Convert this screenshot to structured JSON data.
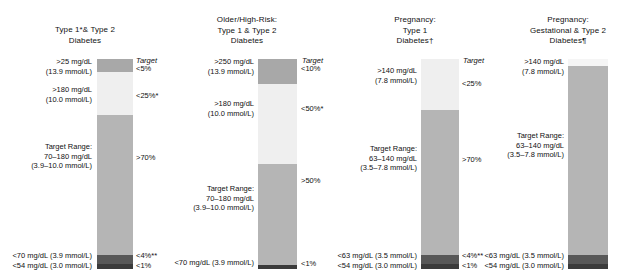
{
  "chart_data": {
    "type": "bar",
    "title": "",
    "subtitle": "",
    "xlabel": "",
    "ylabel": "",
    "ylim": [
      0,
      100
    ],
    "grid": false,
    "legend_position": "none",
    "orientation": "vertical-stacked",
    "target_header": "Target",
    "categories": [
      "Type 1*& Type 2 Diabetes",
      "Older/High-Risk: Type 1 & Type 2 Diabetes",
      "Pregnancy: Type 1 Diabetes",
      "Pregnancy: Gestational & Type 2 Diabetes"
    ],
    "series": [
      {
        "name": "Very High",
        "values": [
          5,
          10,
          0,
          0
        ]
      },
      {
        "name": "High",
        "values": [
          20,
          40,
          25,
          3
        ]
      },
      {
        "name": "Target Range",
        "values": [
          70,
          50,
          70,
          93
        ]
      },
      {
        "name": "Low / Very Low",
        "values": [
          5,
          1,
          5,
          4
        ]
      }
    ],
    "colors": {
      "very_high": "#a8a8a8",
      "high": "#ededed",
      "target_range": "#b5b5b5",
      "low": "#5a5a5a",
      "very_low": "#3d3d3d",
      "text": "#111111",
      "background": "#ffffff"
    }
  },
  "columns": [
    {
      "id": "type1-type2",
      "header_lines": [
        "Type 1*& Type 2",
        "Diabetes"
      ],
      "target_header": "Target",
      "left_labels": [
        {
          "lines": [
            "&gt;25 mg/dL",
            "(13.9 mmol/L)"
          ]
        },
        {
          "lines": [
            "&gt;180 mg/dL",
            "(10.0 mmol/L)"
          ]
        },
        {
          "lines": [
            "Target Range:",
            "70–180 mg/dL",
            "(3.9–10.0 mmol/L)"
          ]
        },
        {
          "lines": [
            "&lt;70 mg/dL (3.9 mmol/L)"
          ]
        },
        {
          "lines": [
            "&lt;54 mg/dL (3.0 mmol/L)"
          ]
        }
      ],
      "right_labels": [
        "&lt;5%",
        "&lt;25%*",
        "&gt;70%",
        "&lt;4%**",
        "&lt;1%"
      ]
    },
    {
      "id": "older-high-risk",
      "header_lines": [
        "Older/High-Risk:",
        "Type 1 & Type 2",
        "Diabetes"
      ],
      "target_header": "Target",
      "left_labels": [
        {
          "lines": [
            "&gt;250 mg/dL",
            "(13.9 mmol/L)"
          ]
        },
        {
          "lines": [
            "&gt;180 mg/dL",
            "(10.0 mmol/L)"
          ]
        },
        {
          "lines": [
            "Target Range:",
            "70–180 mg/dL",
            "(3.9–10.0 mmol/L)"
          ]
        },
        {
          "lines": [
            "&lt;70 mg/dL (3.9 mmol/L)"
          ]
        }
      ],
      "right_labels": [
        "&lt;10%",
        "&lt;50%*",
        "&gt;50%",
        "&lt;1%"
      ]
    },
    {
      "id": "pregnancy-type1",
      "header_lines": [
        "Pregnancy:",
        "Type 1",
        "Diabetes†"
      ],
      "target_header": "Target",
      "left_labels": [
        {
          "lines": [
            "&gt;140 mg/dL",
            "(7.8 mmol/L)"
          ]
        },
        {
          "lines": [
            "Target Range:",
            "63–140 mg/dL",
            "(3.5–7.8 mmol/L)"
          ]
        },
        {
          "lines": [
            "&lt;63 mg/dL (3.5 mmol/L)"
          ]
        },
        {
          "lines": [
            "&lt;54 mg/dL (3.0 mmol/L)"
          ]
        }
      ],
      "right_labels": [
        "&lt;25%",
        "&gt;70%",
        "&lt;4%**",
        "&lt;1%"
      ]
    },
    {
      "id": "pregnancy-gdm-type2",
      "header_lines": [
        "Pregnancy:",
        "Gestational & Type 2",
        "Diabetes¶"
      ],
      "target_header": "",
      "left_labels": [
        {
          "lines": [
            "&gt;140 mg/dL",
            "(7.8 mmol/L)"
          ]
        },
        {
          "lines": [
            "Target Range:",
            "63–140 mg/dL",
            "(3.5–7.8 mmol/L)"
          ]
        },
        {
          "lines": [
            "&lt;63 mg/dL (3.5 mmol/L)"
          ]
        },
        {
          "lines": [
            "&lt;54 mg/dL (3.0 mmol/L)"
          ]
        }
      ],
      "right_labels": []
    }
  ]
}
